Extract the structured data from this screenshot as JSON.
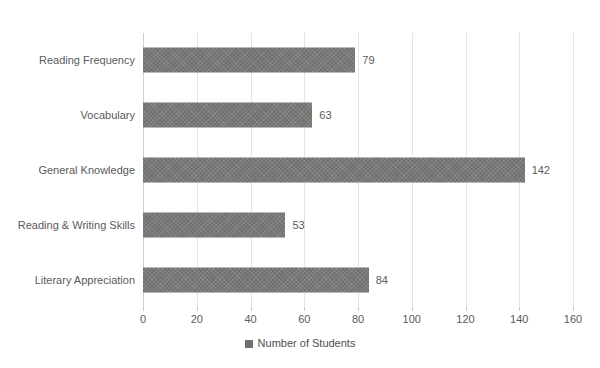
{
  "chart_data": {
    "type": "bar",
    "orientation": "horizontal",
    "title": "",
    "xlabel": "",
    "ylabel": "",
    "categories": [
      "Reading Frequency",
      "Vocabulary",
      "General Knowledge",
      "Reading & Writing Skills",
      "Literary Appreciation"
    ],
    "values": [
      79,
      63,
      142,
      53,
      84
    ],
    "data_labels": [
      "79",
      "63",
      "142",
      "53",
      "84"
    ],
    "series": [
      {
        "name": "Number of Students",
        "values": [
          79,
          63,
          142,
          53,
          84
        ]
      }
    ],
    "xlim": [
      0,
      160
    ],
    "xticks": [
      0,
      20,
      40,
      60,
      80,
      100,
      120,
      140,
      160
    ],
    "xtick_labels": [
      "0",
      "20",
      "40",
      "60",
      "80",
      "100",
      "120",
      "140",
      "160"
    ],
    "grid": "vertical",
    "legend": {
      "position": "bottom",
      "entries": [
        "Number of Students"
      ]
    },
    "bar_color": "#70706f",
    "gridline_color": "#e4e4e4",
    "text_color": "#5a5a5a"
  },
  "caption_remnant": ". . . . . . . . . . . . . . . . . . . . . . . . . . . . . . . . ."
}
